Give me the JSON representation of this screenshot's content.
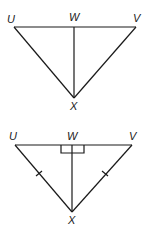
{
  "figures": [
    {
      "id": "figure-1",
      "labels": {
        "U": "U",
        "W": "W",
        "V": "V",
        "X": "X"
      },
      "points": {
        "U": [
          14,
          27
        ],
        "W": [
          74,
          27
        ],
        "V": [
          136,
          27
        ],
        "X": [
          74,
          98
        ]
      },
      "segments": [
        [
          "U",
          "V"
        ],
        [
          "U",
          "X"
        ],
        [
          "V",
          "X"
        ],
        [
          "W",
          "X"
        ]
      ],
      "marks": []
    },
    {
      "id": "figure-2",
      "labels": {
        "U": "U",
        "W": "W",
        "V": "V",
        "X": "X"
      },
      "points": {
        "U": [
          15,
          145
        ],
        "W": [
          72,
          145
        ],
        "V": [
          132,
          145
        ],
        "X": [
          72,
          212
        ]
      },
      "segments": [
        [
          "U",
          "V"
        ],
        [
          "U",
          "X"
        ],
        [
          "V",
          "X"
        ],
        [
          "W",
          "X"
        ]
      ],
      "marks": [
        "right-angle-at-W",
        "tick-UX",
        "tick-VX"
      ]
    }
  ]
}
